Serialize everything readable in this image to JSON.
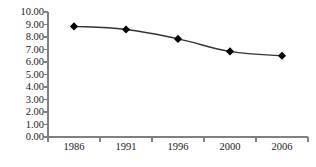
{
  "chart_data": {
    "type": "line",
    "title": "",
    "subtitle": "",
    "xlabel": "",
    "ylabel": "",
    "categories": [
      "1986",
      "1991",
      "1996",
      "2000",
      "2006"
    ],
    "values": [
      8.85,
      8.6,
      7.85,
      6.85,
      6.5
    ],
    "series": [
      {
        "name": "series-1",
        "values": [
          8.85,
          8.6,
          7.85,
          6.85,
          6.5
        ],
        "marker": "diamond",
        "marker_color": "#000000",
        "line_color": "#333333"
      }
    ],
    "ylim": [
      0,
      10
    ],
    "ytick_values": [
      0,
      1,
      2,
      3,
      4,
      5,
      6,
      7,
      8,
      9,
      10
    ],
    "ytick_labels": [
      "0.00",
      "1.00",
      "2.00",
      "3.00",
      "4.00",
      "5.00",
      "6.00",
      "7.00",
      "8.00",
      "9.00",
      "10.00"
    ],
    "grid": false,
    "legend": false,
    "legend_position": "none",
    "axis_color": "#808080",
    "background_color": "#ffffff"
  }
}
